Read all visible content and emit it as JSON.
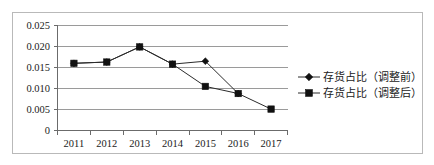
{
  "chart_data": {
    "type": "line",
    "title": "",
    "subtitle": "",
    "xlabel": "",
    "ylabel": "",
    "categories": [
      "2011",
      "2012",
      "2013",
      "2014",
      "2015",
      "2016",
      "2017"
    ],
    "series": [
      {
        "name": "存货占比（调整前）",
        "marker": "diamond",
        "values": [
          0.016,
          0.0163,
          0.0199,
          0.0158,
          0.0165,
          0.0088,
          null
        ]
      },
      {
        "name": "存货占比（调整后）",
        "marker": "square",
        "values": [
          0.016,
          0.0163,
          0.0199,
          0.0158,
          0.0105,
          0.0088,
          0.0051
        ]
      }
    ],
    "ylim": [
      0,
      0.025
    ],
    "yticks": [
      "0",
      "0.005",
      "0.010",
      "0.015",
      "0.020",
      "0.025"
    ],
    "ytick_values": [
      0,
      0.005,
      0.01,
      0.015,
      0.02,
      0.025
    ],
    "xticks": [
      "2011",
      "2012",
      "2013",
      "2014",
      "2015",
      "2016",
      "2017"
    ],
    "grid": true,
    "legend_position": "right",
    "colors": {
      "line": "#2b2b2b",
      "marker": "#111111",
      "grid": "#9a9a9a",
      "axis": "#6b6b6b",
      "frame": "#b9b9b9",
      "text": "#1b1b1b",
      "background": "#ffffff"
    }
  },
  "legend": {
    "entries": [
      {
        "label": "存货占比（调整前）",
        "marker": "diamond-marker"
      },
      {
        "label": "存货占比（调整后）",
        "marker": "square-marker"
      }
    ]
  },
  "axes": {
    "y": {
      "labels": [
        "0.025",
        "0.020",
        "0.015",
        "0.010",
        "0.005",
        "0"
      ]
    },
    "x": {
      "labels": [
        "2011",
        "2012",
        "2013",
        "2014",
        "2015",
        "2016",
        "2017"
      ]
    }
  }
}
